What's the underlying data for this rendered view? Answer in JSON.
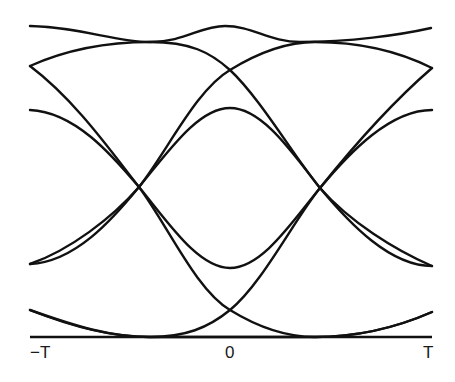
{
  "diagram": {
    "type": "eye-diagram",
    "stroke_color": "#111111",
    "background": "#ffffff",
    "x_axis": {
      "tick_labels": [
        "−T",
        "0",
        "T"
      ]
    },
    "traces": [
      {
        "name": "top-bump",
        "d": "M30,26 C80,27 115,42 150,42 C185,42 200,26 225,26 C252,26 270,42 300,42 C350,42 400,35 431,28"
      },
      {
        "name": "high-to-low",
        "d": "M30,66 C70,48 110,42 150,42 C190,42 210,52 230,70 C260,98 295,158 320,188 C350,222 395,250 432,266"
      },
      {
        "name": "high-falling",
        "d": "M30,66 C75,100 110,150 139,187 C168,226 196,290 230,310 C256,326 285,337 315,337 C360,337 400,326 432,312"
      },
      {
        "name": "mid-high-falling",
        "d": "M30,110 C75,112 112,155 139,187 C168,222 198,268 230,268 C262,268 292,222 320,188 C350,152 390,110 432,110"
      },
      {
        "name": "mid-low-rising",
        "d": "M30,264 C75,262 112,220 139,187 C168,152 198,108 230,108 C262,108 292,152 320,188 C350,224 390,266 432,266"
      },
      {
        "name": "low-rising",
        "d": "M30,264 C70,250 112,218 139,187 C168,150 196,90 230,70 C256,54 285,42 315,42 C360,42 400,52 432,68"
      },
      {
        "name": "bottom-rising",
        "d": "M30,310 C75,328 115,337 150,337 C185,337 208,328 230,310 C262,284 294,220 320,188 C352,148 395,100 432,68"
      },
      {
        "name": "bottom-dip",
        "d": "M30,310 C75,326 110,337 150,337 C185,337 205,337 230,337 C260,337 290,337 315,337 C360,337 400,326 432,312"
      }
    ],
    "baseline": {
      "x1": 30,
      "x2": 432,
      "y": 337
    }
  }
}
